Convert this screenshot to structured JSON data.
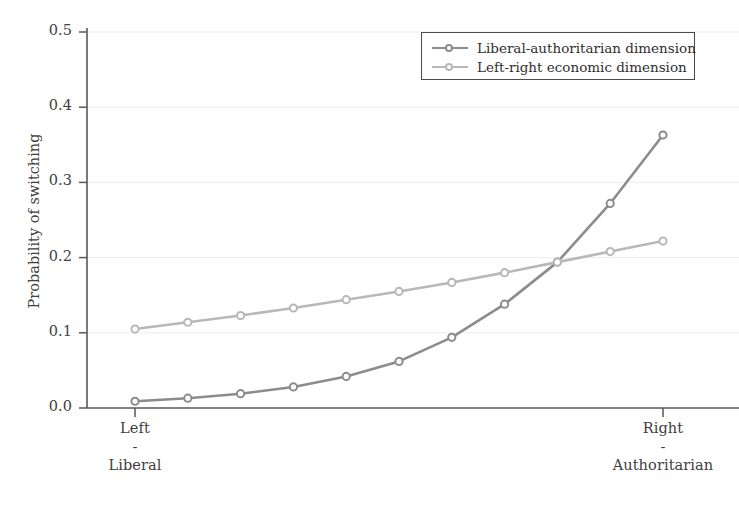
{
  "chart_data": {
    "type": "line",
    "title": "",
    "xlabel": "",
    "ylabel": "Probability of switching",
    "ylim": [
      0.0,
      0.5
    ],
    "xlim": [
      0,
      10
    ],
    "grid": true,
    "grid_axis": "y",
    "legend_position": "top-right",
    "y_ticks": [
      "0.0",
      "0.1",
      "0.2",
      "0.3",
      "0.4",
      "0.5"
    ],
    "y_tick_values": [
      0.0,
      0.1,
      0.2,
      0.3,
      0.4,
      0.5
    ],
    "x_tick_labels": [
      {
        "line1": "Left",
        "line2": "-",
        "line3": "Liberal"
      },
      {
        "line1": "Right",
        "line2": "-",
        "line3": "Authoritarian"
      }
    ],
    "x": [
      0,
      1,
      2,
      3,
      4,
      5,
      6,
      7,
      8,
      9,
      10
    ],
    "series": [
      {
        "name": "Liberal-authoritarian dimension",
        "color": "#8c8c8c",
        "marker": "circle-open",
        "values": [
          0.009,
          0.013,
          0.019,
          0.028,
          0.042,
          0.062,
          0.094,
          0.138,
          0.194,
          0.272,
          0.363
        ]
      },
      {
        "name": "Left-right economic dimension",
        "color": "#b8b8b8",
        "marker": "circle-open",
        "values": [
          0.105,
          0.114,
          0.123,
          0.133,
          0.144,
          0.155,
          0.167,
          0.18,
          0.194,
          0.208,
          0.222
        ]
      }
    ]
  },
  "axis": {
    "y_label": "Probability of switching",
    "y_ticks": [
      "0.0",
      "0.1",
      "0.2",
      "0.3",
      "0.4",
      "0.5"
    ],
    "x_left": {
      "line1": "Left",
      "line2": "-",
      "line3": "Liberal"
    },
    "x_right": {
      "line1": "Right",
      "line2": "-",
      "line3": "Authoritarian"
    }
  },
  "legend": {
    "entries": [
      {
        "label": "Liberal-authoritarian dimension",
        "color": "#8c8c8c"
      },
      {
        "label": "Left-right economic dimension",
        "color": "#b8b8b8"
      }
    ]
  },
  "colors": {
    "axis": "#585858",
    "grid": "#ededed",
    "text": "#3a3a3a",
    "series_dark": "#8c8c8c",
    "series_light": "#b8b8b8",
    "background": "#ffffff"
  }
}
